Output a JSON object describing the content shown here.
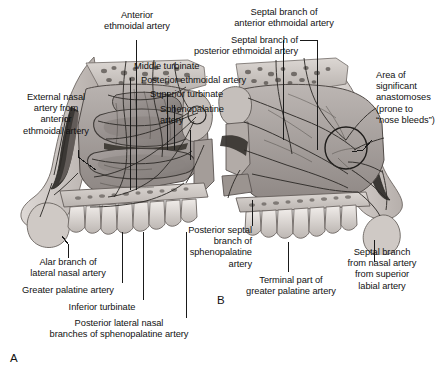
{
  "figure": {
    "panels": [
      {
        "id": "A",
        "letter": "A",
        "caption": "Lateral nasal wall"
      },
      {
        "id": "B",
        "letter": "B",
        "caption": "Nasal septum"
      }
    ],
    "background_color": "#ffffff",
    "text_color": "#121212",
    "leader_line_color": "#1a1a1a"
  },
  "labels": {
    "anterior_ethmoidal_artery": "Anterior\nethmoidal artery",
    "septal_branch_posterior_ethmoidal": "Septal branch of\nposterior ethmoidal artery",
    "septal_branch_anterior_ethmoidal": "Septal branch of\nanterior ethmoidal artery",
    "middle_turbinate": "Middle turbinate",
    "posterior_ethmoidal_artery": "Posterior ethmoidal artery",
    "superior_turbinate": "Superior turbinate",
    "sphenopalatine_artery": "Sphenopalatine\nartery",
    "external_nasal_artery": "External nasal\nartery from\nanterior\nethmoidal artery",
    "area_of_anastomoses": "Area of\nsignificant\nanastomoses\n(prone to\n“nose bleeds”)",
    "posterior_septal_branch": "Posterior septal\nbranch of\nsphenopalatine\nartery",
    "alar_branch": "Alar branch of\nlateral nasal artery",
    "greater_palatine_artery": "Greater palatine artery",
    "inferior_turbinate": "Inferior turbinate",
    "posterior_lateral_nasal_branches": "Posterior lateral nasal\nbranches of sphenopalatine artery",
    "terminal_part_greater_palatine": "Terminal part of\ngreater palatine artery",
    "septal_branch_superior_labial": "Septal branch\nfrom nasal artery\nfrom superior\nlabial artery"
  }
}
